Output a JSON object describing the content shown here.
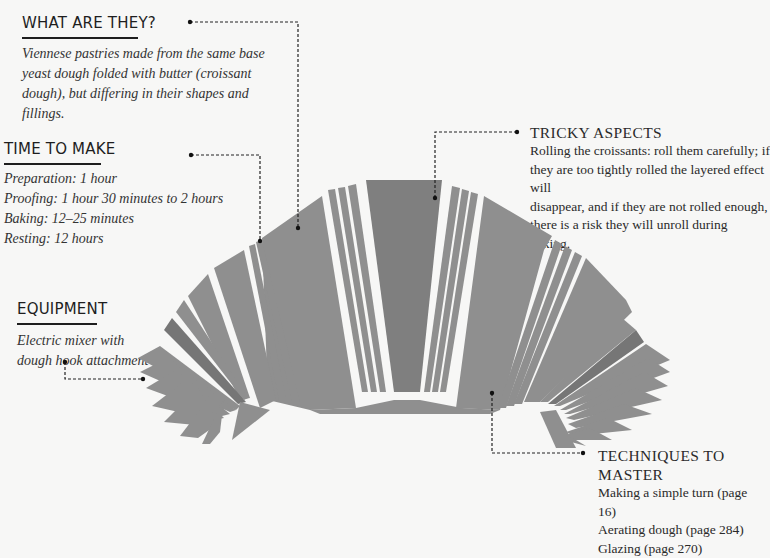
{
  "sections": {
    "what_are_they": {
      "heading": "WHAT ARE THEY?",
      "lines": [
        "Viennese pastries made from the same base",
        "yeast dough folded with butter (croissant",
        "dough), but differing in their shapes and",
        "fillings."
      ]
    },
    "time_to_make": {
      "heading": "TIME TO MAKE",
      "lines": [
        "Preparation: 1 hour",
        "Proofing: 1 hour 30 minutes to 2 hours",
        "Baking: 12–25 minutes",
        "Resting: 12 hours"
      ]
    },
    "equipment": {
      "heading": "EQUIPMENT",
      "lines": [
        "Electric mixer with",
        "dough hook attachment"
      ]
    },
    "tricky_aspects": {
      "heading": "TRICKY ASPECTS",
      "lines": [
        "Rolling the croissants: roll them carefully; if",
        "they are too tightly rolled the layered effect will",
        "disappear, and if they are not rolled enough,",
        "there is a risk they will unroll during baking."
      ]
    },
    "techniques": {
      "heading_lines": [
        "TECHNIQUES TO",
        "MASTER"
      ],
      "lines": [
        "Making a simple turn (page 16)",
        "Aerating dough (page 284)",
        "Glazing (page 270)"
      ]
    }
  },
  "illustration": {
    "subject": "croissant-diagram",
    "colors": {
      "background": "#f7f7f6",
      "segment": "#8f8f8f",
      "segment_dark": "#777777",
      "gap": "#f7f7f6",
      "leader": "#222222"
    }
  }
}
